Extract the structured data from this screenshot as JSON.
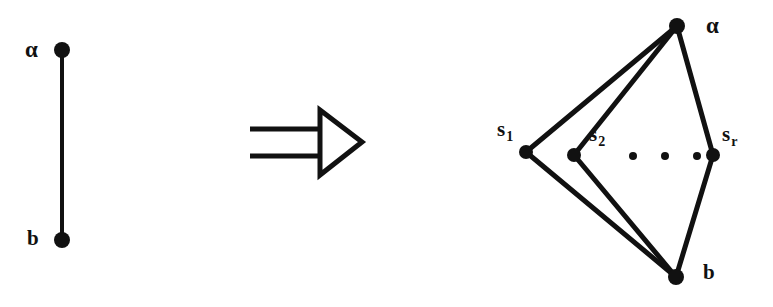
{
  "figure": {
    "type": "math-diagram",
    "background_color": "#ffffff",
    "ink_color": "#111111"
  },
  "left_graph": {
    "name": "single-edge-graph",
    "vertices": [
      {
        "id": "a",
        "label": "α",
        "x": 62,
        "y": 50
      },
      {
        "id": "b",
        "label": "b",
        "x": 62,
        "y": 240
      }
    ],
    "edges": [
      {
        "from": "a",
        "to": "b"
      }
    ],
    "labels": [
      {
        "for": "a",
        "text": "α",
        "x": 25,
        "y": 38
      },
      {
        "for": "b",
        "text": "b",
        "x": 27,
        "y": 228
      }
    ]
  },
  "arrow": {
    "name": "implies-arrow",
    "glyph": "⟹",
    "style": "double-shaft open-triangle head",
    "x1": 250,
    "x2": 362,
    "y": 142
  },
  "right_graph": {
    "name": "expanded-graph",
    "vertices": [
      {
        "id": "a",
        "label": "α",
        "x": 677,
        "y": 26
      },
      {
        "id": "s1",
        "label": "s",
        "subscript": "1",
        "x": 526,
        "y": 152
      },
      {
        "id": "s2",
        "label": "s",
        "subscript": "2",
        "x": 574,
        "y": 155
      },
      {
        "id": "sr",
        "label": "s",
        "subscript": "r",
        "x": 713,
        "y": 155
      },
      {
        "id": "b",
        "label": "b",
        "x": 676,
        "y": 277
      }
    ],
    "edges": [
      {
        "from": "a",
        "to": "s1"
      },
      {
        "from": "a",
        "to": "s2"
      },
      {
        "from": "a",
        "to": "sr"
      },
      {
        "from": "s1",
        "to": "b"
      },
      {
        "from": "s2",
        "to": "b"
      },
      {
        "from": "sr",
        "to": "b"
      }
    ],
    "ellipsis_dots": [
      {
        "x": 633,
        "y": 156
      },
      {
        "x": 665,
        "y": 156
      },
      {
        "x": 697,
        "y": 156
      }
    ],
    "labels": [
      {
        "for": "a",
        "text": "α",
        "x": 706,
        "y": 14
      },
      {
        "for": "s1",
        "text": "s",
        "subscript": "1",
        "x": 497,
        "y": 119
      },
      {
        "for": "s2",
        "text": "s",
        "subscript": "2",
        "x": 589,
        "y": 124
      },
      {
        "for": "sr",
        "text": "s",
        "subscript": "r",
        "x": 722,
        "y": 124
      },
      {
        "for": "b",
        "text": "b",
        "x": 703,
        "y": 262
      }
    ]
  }
}
